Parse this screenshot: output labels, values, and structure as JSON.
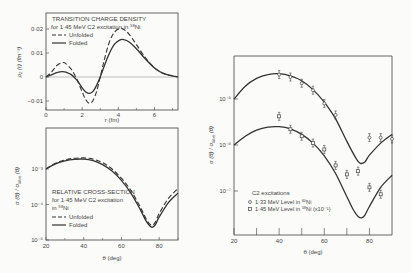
{
  "chart_data": [
    {
      "id": "charge-density",
      "type": "line",
      "title": "TRANSITION CHARGE DENSITY",
      "subtitle": "for 1·45 MeV C2 excitation in 58Ni",
      "xlabel": "r (fm)",
      "ylabel": "ρ₂ (r)  (fm⁻³)",
      "xlim": [
        0,
        7.3
      ],
      "ylim": [
        -0.014,
        0.025
      ],
      "xticks": [
        0,
        2,
        4,
        6
      ],
      "xtick_labels": [
        "0",
        "2",
        "4",
        "6"
      ],
      "yticks": [
        0.02,
        0.01,
        0,
        -0.01
      ],
      "ytick_labels": [
        "0·02",
        "0·01",
        "0",
        "−0·01"
      ],
      "legend": [
        "Unfolded",
        "Folded"
      ],
      "series": [
        {
          "name": "Unfolded",
          "style": "dashed",
          "x": [
            0,
            0.3,
            0.6,
            0.9,
            1.1,
            1.4,
            1.7,
            2.0,
            2.2,
            2.4,
            2.6,
            2.8,
            3.0,
            3.2,
            3.5,
            3.8,
            4.1,
            4.3,
            4.6,
            5.0,
            5.5,
            6.0,
            6.5,
            7.0,
            7.3
          ],
          "y": [
            0,
            0.002,
            0.0048,
            0.006,
            0.0056,
            0.0032,
            -0.0008,
            -0.0062,
            -0.0095,
            -0.011,
            -0.0098,
            -0.006,
            0.0,
            0.0065,
            0.0145,
            0.0188,
            0.0202,
            0.0198,
            0.0178,
            0.0135,
            0.008,
            0.0038,
            0.0014,
            0.0004,
            0.0001
          ]
        },
        {
          "name": "Folded",
          "style": "solid",
          "x": [
            0,
            0.3,
            0.6,
            0.9,
            1.1,
            1.4,
            1.7,
            2.0,
            2.2,
            2.4,
            2.6,
            2.8,
            3.0,
            3.2,
            3.5,
            3.8,
            4.1,
            4.3,
            4.6,
            5.0,
            5.5,
            6.0,
            6.5,
            7.0,
            7.3
          ],
          "y": [
            0,
            0.0009,
            0.0018,
            0.0022,
            0.002,
            0.001,
            -0.0012,
            -0.0045,
            -0.0062,
            -0.0068,
            -0.006,
            -0.0035,
            0.0,
            0.0042,
            0.0098,
            0.0138,
            0.0155,
            0.0156,
            0.0146,
            0.0118,
            0.0075,
            0.0038,
            0.0015,
            0.0005,
            0.0001
          ]
        }
      ]
    },
    {
      "id": "relative-cross-section",
      "type": "line",
      "title": "RELATIVE CROSS-SECTION",
      "subtitle": "for 1·45 MeV C2 excitation in 58Ni",
      "xlabel": "θ (deg)",
      "ylabel": "σ (θ) / σ_Mott (θ)",
      "yscale": "log",
      "xlim": [
        20,
        90
      ],
      "ylim": [
        1e-05,
        0.003
      ],
      "xticks": [
        20,
        40,
        60,
        80
      ],
      "xtick_labels": [
        "20",
        "40",
        "60",
        "80"
      ],
      "yticks": [
        0.001,
        0.0001,
        1e-05
      ],
      "ytick_labels": [
        "10⁻³",
        "10⁻⁴",
        "10⁻⁵"
      ],
      "legend": [
        "Unfolded",
        "Folded"
      ],
      "series": [
        {
          "name": "Unfolded",
          "style": "dashed",
          "x": [
            20,
            25,
            30,
            35,
            40,
            45,
            50,
            55,
            60,
            65,
            70,
            73,
            75,
            76.5,
            78,
            80,
            85,
            90
          ],
          "y": [
            0.001,
            0.00145,
            0.0018,
            0.002,
            0.00205,
            0.0019,
            0.0015,
            0.001,
            0.00055,
            0.00025,
            8.5e-05,
            4e-05,
            2.8e-05,
            2.6e-05,
            3.2e-05,
            5.5e-05,
            0.00015,
            0.00028
          ]
        },
        {
          "name": "Folded",
          "style": "solid",
          "x": [
            20,
            25,
            30,
            35,
            40,
            45,
            50,
            55,
            60,
            65,
            70,
            73,
            75,
            76.5,
            78,
            80,
            85,
            90
          ],
          "y": [
            0.001,
            0.0014,
            0.0017,
            0.00188,
            0.0019,
            0.00172,
            0.00133,
            0.00088,
            0.00048,
            0.00021,
            7.2e-05,
            3.5e-05,
            2.5e-05,
            2.3e-05,
            2.7e-05,
            4.4e-05,
            0.000115,
            0.00021
          ]
        }
      ]
    },
    {
      "id": "c2-excitations",
      "type": "scatter",
      "title": "C2 excitations",
      "xlabel": "θ (deg)",
      "ylabel": "σ (θ) / σ_Mott (θ)",
      "yscale": "log",
      "xlim": [
        20,
        90
      ],
      "ylim": [
        2e-08,
        8e-05
      ],
      "xticks": [
        20,
        30,
        40,
        50,
        60,
        70,
        80
      ],
      "xtick_labels": [
        "20",
        "",
        "40",
        "",
        "60",
        "",
        "80"
      ],
      "yticks": [
        1e-05,
        1e-06,
        1e-07
      ],
      "ytick_labels": [
        "10⁻⁵",
        "10⁻⁶",
        "10⁻⁷"
      ],
      "legend": [
        "1·33 MeV  Level in 60Ni",
        "1·45 MeV  Level in 58Ni (x10⁻¹)"
      ],
      "series": [
        {
          "name": "1·33 MeV Level in 60Ni",
          "marker": "circle",
          "x": [
            40,
            45,
            50,
            55,
            60,
            65,
            80,
            85,
            90
          ],
          "y": [
            3.4e-05,
            3e-05,
            2.2e-05,
            1.55e-05,
            8e-06,
            4.5e-06,
            1.45e-06,
            1.45e-06,
            1.35e-06
          ],
          "fit_x": [
            20,
            25,
            30,
            35,
            40,
            45,
            50,
            55,
            60,
            65,
            70,
            74,
            76,
            78,
            80,
            85,
            90
          ],
          "fit_y": [
            1e-05,
            1.9e-05,
            2.8e-05,
            3.4e-05,
            3.55e-05,
            3.2e-05,
            2.5e-05,
            1.6e-05,
            8.5e-06,
            3.7e-06,
            1.2e-06,
            5.2e-07,
            4e-07,
            4.3e-07,
            6e-07,
            1.1e-06,
            1.7e-06
          ]
        },
        {
          "name": "1·45 MeV Level in 58Ni (x10⁻¹)",
          "marker": "square",
          "x": [
            40,
            45,
            50,
            55,
            60,
            65,
            70,
            75,
            80,
            85
          ],
          "y": [
            4.2e-06,
            2.2e-06,
            1.55e-06,
            1.1e-06,
            8e-07,
            3.6e-07,
            2.3e-07,
            2.7e-07,
            1.2e-07,
            8.5e-08
          ],
          "fit_x": [
            20,
            25,
            30,
            35,
            40,
            45,
            50,
            55,
            60,
            65,
            70,
            73,
            75,
            76.5,
            78,
            80,
            85,
            90
          ],
          "fit_y": [
            1e-06,
            1.55e-06,
            2.1e-06,
            2.45e-06,
            2.5e-06,
            2.25e-06,
            1.7e-06,
            1.1e-06,
            5.8e-07,
            2.4e-07,
            7.5e-08,
            3.8e-08,
            2.8e-08,
            2.6e-08,
            3e-08,
            4.6e-08,
            1.2e-07,
            2.2e-07
          ]
        }
      ]
    }
  ],
  "labels": {
    "p1_title": "TRANSITION CHARGE DENSITY",
    "p1_sub_pre": "for 1·45 MeV  C2 excitation in ",
    "p1_sub_iso": "58",
    "p1_sub_el": "Ni",
    "leg_unfolded": "Unfolded",
    "leg_folded": "Folded",
    "p1_ylabel": "ρ₂ (r)   (fm⁻³)",
    "p1_xlabel": "r (fm)",
    "p2_title": "RELATIVE CROSS-SECTION",
    "p2_sub": "for 1·45 MeV C2 excitation",
    "p2_sub2_pre": "in ",
    "p2_iso": "58",
    "p2_el": "Ni",
    "p2_ylabel": "σ (θ) / σ",
    "p2_ylabel_sub": "Mott",
    "p2_ylabel_end": " (θ)",
    "p2_xlabel": "θ (deg)",
    "p3_leg_title": "C2 excitations",
    "p3_leg1_pre": "1·33 MeV  Level in ",
    "p3_leg1_iso": "60",
    "p3_leg1_el": "Ni",
    "p3_leg2_pre": "1·45 MeV  Level in ",
    "p3_leg2_iso": "58",
    "p3_leg2_el": "Ni",
    "p3_leg2_end": " (x10⁻¹)",
    "p3_ylabel": "σ (θ) / σ",
    "p3_ylabel_sub": "Mott",
    "p3_ylabel_end": " (θ)",
    "p3_xlabel": "θ (deg)"
  },
  "colors": {
    "ink": "#3a3a3a",
    "background": "#fbfbfa"
  }
}
